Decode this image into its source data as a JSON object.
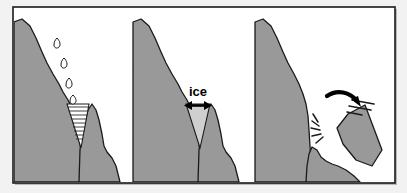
{
  "figure": {
    "panel_count": 3,
    "frame": {
      "border_color": "#1a1a1a",
      "background_color": "#ffffff",
      "outer_margin_color": "#f0f0f0"
    },
    "colors": {
      "rock_gray": "#999999",
      "rock_gray_dark": "#8c8c8c",
      "ice_gray": "#cfcfcf",
      "water_line": "#333333",
      "outline": "#1a1a1a",
      "arrow_black": "#000000",
      "white": "#ffffff"
    }
  },
  "panels": [
    {
      "index": 1,
      "name": "water-enters-crack",
      "caption": "",
      "elements": {
        "droplet_count": 4,
        "water_fill_lines": 9,
        "crack_shape": "v-notch"
      }
    },
    {
      "index": 2,
      "name": "water-freezes-expands",
      "caption": "",
      "label": "ice",
      "elements": {
        "arrow_type": "double-headed-horizontal",
        "ice_wedge": "light-gray-triangle"
      }
    },
    {
      "index": 3,
      "name": "rock-fragment-breaks-away",
      "caption": "",
      "elements": {
        "arrow_type": "curved-falling",
        "motion_line_count": 3,
        "impact_line_count": 5,
        "detached_block": "triangular-boulder"
      }
    }
  ]
}
